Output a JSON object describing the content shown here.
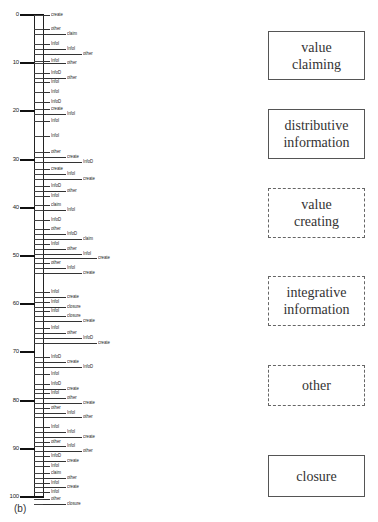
{
  "figure": {
    "panel_label": "(b)",
    "axis": {
      "min": 0,
      "max": 100,
      "major_ticks": [
        0,
        10,
        20,
        30,
        40,
        50,
        60,
        70,
        80,
        90,
        100
      ],
      "tick_labels": [
        "0",
        "10",
        "20",
        "30",
        "40",
        "50",
        "60",
        "70",
        "80",
        "90",
        "100"
      ]
    },
    "events": [
      {
        "t": 0,
        "label": "create",
        "level": 1
      },
      {
        "t": 3,
        "label": "other",
        "level": 1
      },
      {
        "t": 4,
        "label": "claim",
        "level": 2
      },
      {
        "t": 6,
        "label": "InfoI",
        "level": 1
      },
      {
        "t": 7,
        "label": "InfoI",
        "level": 2
      },
      {
        "t": 8,
        "label": "other",
        "level": 3
      },
      {
        "t": 9.5,
        "label": "InfoI",
        "level": 1
      },
      {
        "t": 10,
        "label": "other",
        "level": 2
      },
      {
        "t": 12,
        "label": "InfoD",
        "level": 1
      },
      {
        "t": 13,
        "label": "other",
        "level": 2
      },
      {
        "t": 14,
        "label": "InfoI",
        "level": 1
      },
      {
        "t": 16,
        "label": "InfoI",
        "level": 1
      },
      {
        "t": 18,
        "label": "InfoD",
        "level": 1
      },
      {
        "t": 19.5,
        "label": "create",
        "level": 1
      },
      {
        "t": 20.5,
        "label": "InfoI",
        "level": 2
      },
      {
        "t": 22,
        "label": "InfoI",
        "level": 1
      },
      {
        "t": 25,
        "label": "InfoI",
        "level": 1
      },
      {
        "t": 28.5,
        "label": "other",
        "level": 1
      },
      {
        "t": 29.5,
        "label": "create",
        "level": 2
      },
      {
        "t": 30.5,
        "label": "InfoD",
        "level": 3
      },
      {
        "t": 32,
        "label": "create",
        "level": 1
      },
      {
        "t": 33,
        "label": "InfoI",
        "level": 2
      },
      {
        "t": 34,
        "label": "create",
        "level": 3
      },
      {
        "t": 35.5,
        "label": "InfoD",
        "level": 1
      },
      {
        "t": 36.5,
        "label": "other",
        "level": 2
      },
      {
        "t": 37.5,
        "label": "InfoI",
        "level": 1
      },
      {
        "t": 39.5,
        "label": "claim",
        "level": 1
      },
      {
        "t": 40.5,
        "label": "InfoI",
        "level": 2
      },
      {
        "t": 42.5,
        "label": "InfoD",
        "level": 1
      },
      {
        "t": 44.5,
        "label": "other",
        "level": 1
      },
      {
        "t": 45.5,
        "label": "InfoD",
        "level": 2
      },
      {
        "t": 46.5,
        "label": "claim",
        "level": 3
      },
      {
        "t": 47.5,
        "label": "InfoI",
        "level": 1
      },
      {
        "t": 48.5,
        "label": "other",
        "level": 2
      },
      {
        "t": 49.5,
        "label": "InfoI",
        "level": 3
      },
      {
        "t": 50.5,
        "label": "create",
        "level": 4
      },
      {
        "t": 51.5,
        "label": "other",
        "level": 1
      },
      {
        "t": 52.5,
        "label": "InfoI",
        "level": 2
      },
      {
        "t": 53.5,
        "label": "create",
        "level": 3
      },
      {
        "t": 57.5,
        "label": "InfoI",
        "level": 1
      },
      {
        "t": 58.5,
        "label": "create",
        "level": 2
      },
      {
        "t": 59.5,
        "label": "InfoI",
        "level": 1
      },
      {
        "t": 60.5,
        "label": "closure",
        "level": 2
      },
      {
        "t": 61.5,
        "label": "InfoI",
        "level": 1
      },
      {
        "t": 62.5,
        "label": "closure",
        "level": 2
      },
      {
        "t": 63.5,
        "label": "create",
        "level": 3
      },
      {
        "t": 65,
        "label": "InfoI",
        "level": 1
      },
      {
        "t": 66,
        "label": "other",
        "level": 2
      },
      {
        "t": 67,
        "label": "InfoD",
        "level": 3
      },
      {
        "t": 68,
        "label": "create",
        "level": 4
      },
      {
        "t": 71,
        "label": "InfoD",
        "level": 1
      },
      {
        "t": 72,
        "label": "create",
        "level": 2
      },
      {
        "t": 73,
        "label": "InfoD",
        "level": 3
      },
      {
        "t": 74.5,
        "label": "InfoI",
        "level": 1
      },
      {
        "t": 76.5,
        "label": "InfoD",
        "level": 1
      },
      {
        "t": 77.5,
        "label": "create",
        "level": 2
      },
      {
        "t": 78.5,
        "label": "InfoI",
        "level": 1
      },
      {
        "t": 79.5,
        "label": "other",
        "level": 2
      },
      {
        "t": 80.5,
        "label": "create",
        "level": 3
      },
      {
        "t": 81.5,
        "label": "other",
        "level": 1
      },
      {
        "t": 82.5,
        "label": "InfoI",
        "level": 2
      },
      {
        "t": 83.5,
        "label": "other",
        "level": 3
      },
      {
        "t": 85.5,
        "label": "InfoI",
        "level": 1
      },
      {
        "t": 86.5,
        "label": "InfoI",
        "level": 2
      },
      {
        "t": 87.5,
        "label": "create",
        "level": 3
      },
      {
        "t": 88.5,
        "label": "other",
        "level": 1
      },
      {
        "t": 89.5,
        "label": "InfoI",
        "level": 2
      },
      {
        "t": 90.5,
        "label": "other",
        "level": 3
      },
      {
        "t": 91.5,
        "label": "InfoD",
        "level": 1
      },
      {
        "t": 92.5,
        "label": "create",
        "level": 2
      },
      {
        "t": 93.5,
        "label": "InfoI",
        "level": 1
      },
      {
        "t": 95,
        "label": "claim",
        "level": 1
      },
      {
        "t": 96,
        "label": "other",
        "level": 2
      },
      {
        "t": 97,
        "label": "InfoI",
        "level": 1
      },
      {
        "t": 98,
        "label": "create",
        "level": 2
      },
      {
        "t": 99,
        "label": "InfoI",
        "level": 1
      },
      {
        "t": 100.5,
        "label": "other",
        "level": 1
      },
      {
        "t": 101.5,
        "label": "closure",
        "level": 2
      }
    ],
    "categories": [
      {
        "label": "value claiming",
        "line1": "value",
        "line2": "claiming",
        "border": "solid"
      },
      {
        "label": "distributive information",
        "line1": "distributive",
        "line2": "information",
        "border": "solid"
      },
      {
        "label": "value creating",
        "line1": "value",
        "line2": "creating",
        "border": "dashed"
      },
      {
        "label": "integrative information",
        "line1": "integrative",
        "line2": "information",
        "border": "dashed"
      },
      {
        "label": "other",
        "line1": "other",
        "line2": "",
        "border": "dashed"
      },
      {
        "label": "closure",
        "line1": "closure",
        "line2": "",
        "border": "solid"
      }
    ]
  }
}
